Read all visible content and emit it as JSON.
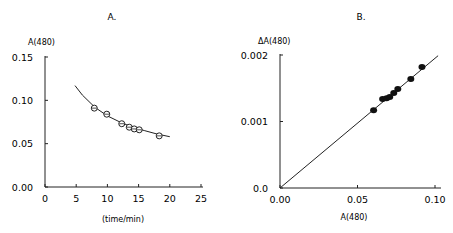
{
  "chart_data": [
    {
      "panel": "A.",
      "type": "scatter",
      "title": "A.",
      "xlabel": "(time/min)",
      "ylabel": "A(480)",
      "xlim": [
        0,
        25
      ],
      "ylim": [
        0,
        0.15
      ],
      "xticks": [
        "0",
        "5",
        "10",
        "15",
        "20",
        "25"
      ],
      "yticks": [
        "0.00",
        "0.05",
        "0.10",
        "0.15"
      ],
      "grid": false,
      "marker": "open-circle",
      "series": [
        {
          "name": "data",
          "x": [
            7.9,
            9.9,
            12.3,
            13.5,
            14.3,
            15.1,
            18.3
          ],
          "y": [
            0.091,
            0.084,
            0.073,
            0.069,
            0.067,
            0.066,
            0.059
          ]
        },
        {
          "name": "fit curve",
          "type": "line",
          "x": [
            4.8,
            6,
            8,
            10,
            12,
            14,
            16,
            18,
            20
          ],
          "y": [
            0.117,
            0.106,
            0.092,
            0.082,
            0.075,
            0.069,
            0.065,
            0.061,
            0.058
          ]
        }
      ]
    },
    {
      "panel": "B.",
      "type": "scatter",
      "title": "B.",
      "xlabel": "A(480)",
      "ylabel": "ΔA(480)",
      "xlim": [
        0,
        0.1
      ],
      "ylim": [
        0,
        0.002
      ],
      "xticks": [
        "0.00",
        "0.05",
        "0.10"
      ],
      "yticks": [
        "0.0",
        "0.001",
        "0.002"
      ],
      "grid": false,
      "marker": "filled-circle",
      "series": [
        {
          "name": "data",
          "x": [
            0.0604,
            0.0662,
            0.0688,
            0.0708,
            0.0734,
            0.076,
            0.0844,
            0.0916
          ],
          "y": [
            0.00117,
            0.00134,
            0.00135,
            0.00137,
            0.00143,
            0.00149,
            0.00164,
            0.00182
          ]
        },
        {
          "name": "linear fit",
          "type": "line",
          "x": [
            0,
            0.102
          ],
          "y": [
            0,
            0.00199
          ]
        }
      ]
    }
  ]
}
